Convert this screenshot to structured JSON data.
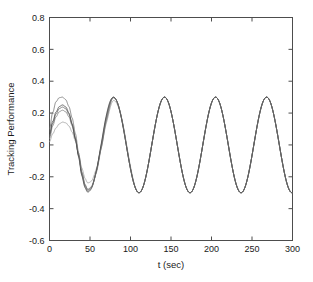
{
  "figure": {
    "background_color": "#ffffff",
    "axes_color": "#4d4d4d",
    "text_color": "#1a1a1a"
  },
  "chart_data": {
    "type": "line",
    "title": "",
    "xlabel": "t (sec)",
    "ylabel": "Tracking Performance",
    "xlim": [
      0,
      300
    ],
    "ylim": [
      -0.6,
      0.8
    ],
    "xticks": [
      0,
      50,
      100,
      150,
      200,
      250,
      300
    ],
    "xticklabels": [
      "0",
      "50",
      "100",
      "150",
      "200",
      "250",
      "300"
    ],
    "yticks": [
      -0.6,
      -0.4,
      -0.2,
      0,
      0.2,
      0.4,
      0.6,
      0.8
    ],
    "yticklabels": [
      "-0.6",
      "-0.4",
      "-0.2",
      "0",
      "0.2",
      "0.4",
      "0.6",
      "0.8"
    ],
    "grid": false,
    "legend": null,
    "legend_position": "none",
    "box": true,
    "steady_state": {
      "amplitude": 0.3,
      "period_sec": 63,
      "first_peak_t": 16,
      "peaks_t": [
        16,
        79,
        142,
        205,
        268
      ],
      "troughs_t": [
        47,
        110,
        173,
        236,
        299
      ],
      "offset": 0.0
    },
    "series": [
      {
        "name": "run-1",
        "color": "#9a9a9a",
        "line_width": 0.8,
        "initial_value": 0.02,
        "first_peak_value": 0.135,
        "first_trough_value": -0.205,
        "settle_t": 120,
        "x": [
          0,
          4,
          8,
          12,
          16,
          20,
          24,
          28,
          32,
          36,
          40,
          44,
          47,
          52,
          58,
          64,
          70,
          79,
          90,
          100,
          110,
          120,
          140,
          160,
          180,
          200,
          220,
          240,
          260,
          280,
          300
        ],
        "y": [
          0.02,
          0.07,
          0.105,
          0.128,
          0.135,
          0.128,
          0.108,
          0.075,
          0.03,
          -0.045,
          -0.12,
          -0.18,
          -0.205,
          -0.195,
          -0.145,
          -0.06,
          0.045,
          0.22,
          0.185,
          0.04,
          -0.24,
          -0.28,
          0.2,
          0.3,
          -0.18,
          -0.29,
          0.11,
          -0.29,
          0.3,
          -0.09,
          -0.3
        ]
      },
      {
        "name": "run-2",
        "color": "#7a7a7a",
        "line_width": 0.8,
        "initial_value": 0.04,
        "first_peak_value": 0.212,
        "first_trough_value": -0.258,
        "settle_t": 100,
        "x": [
          0,
          4,
          8,
          12,
          16,
          20,
          24,
          28,
          32,
          36,
          40,
          44,
          47,
          52,
          58,
          64,
          70,
          79,
          90,
          100,
          110,
          120,
          140,
          160,
          180,
          200,
          220,
          240,
          260,
          280,
          300
        ],
        "y": [
          0.04,
          0.12,
          0.175,
          0.205,
          0.212,
          0.2,
          0.17,
          0.12,
          0.05,
          -0.04,
          -0.15,
          -0.225,
          -0.258,
          -0.245,
          -0.18,
          -0.075,
          0.06,
          0.268,
          0.225,
          0.05,
          -0.285,
          -0.3,
          0.24,
          0.3,
          -0.21,
          -0.3,
          0.13,
          -0.3,
          0.3,
          -0.1,
          -0.3
        ]
      },
      {
        "name": "run-3",
        "color": "#5c5c5c",
        "line_width": 0.8,
        "initial_value": 0.055,
        "first_peak_value": 0.232,
        "first_trough_value": -0.275,
        "settle_t": 90,
        "x": [
          0,
          4,
          8,
          12,
          16,
          20,
          24,
          28,
          32,
          36,
          40,
          44,
          47,
          52,
          58,
          64,
          70,
          79,
          90,
          100,
          110,
          120,
          140,
          160,
          180,
          200,
          220,
          240,
          260,
          280,
          300
        ],
        "y": [
          0.055,
          0.135,
          0.193,
          0.225,
          0.232,
          0.22,
          0.188,
          0.133,
          0.058,
          -0.04,
          -0.16,
          -0.24,
          -0.275,
          -0.26,
          -0.192,
          -0.08,
          0.063,
          0.282,
          0.235,
          0.052,
          -0.295,
          -0.302,
          0.25,
          0.3,
          -0.22,
          -0.3,
          0.14,
          -0.3,
          0.3,
          -0.1,
          -0.3
        ]
      },
      {
        "name": "run-4",
        "color": "#3f3f3f",
        "line_width": 0.8,
        "initial_value": 0.07,
        "first_peak_value": 0.245,
        "first_trough_value": -0.288,
        "settle_t": 80,
        "x": [
          0,
          4,
          8,
          12,
          16,
          20,
          24,
          28,
          32,
          36,
          40,
          44,
          47,
          52,
          58,
          64,
          70,
          79,
          90,
          100,
          110,
          120,
          140,
          160,
          180,
          200,
          220,
          240,
          260,
          280,
          300
        ],
        "y": [
          0.07,
          0.148,
          0.206,
          0.238,
          0.245,
          0.232,
          0.198,
          0.14,
          0.062,
          -0.042,
          -0.168,
          -0.252,
          -0.288,
          -0.272,
          -0.2,
          -0.083,
          0.065,
          0.292,
          0.24,
          0.053,
          -0.3,
          -0.303,
          0.26,
          0.3,
          -0.23,
          -0.3,
          0.14,
          -0.3,
          0.3,
          -0.1,
          -0.3
        ]
      },
      {
        "name": "run-5",
        "color": "#6e6e6e",
        "line_width": 0.8,
        "initial_value": 0.1,
        "first_peak_value": 0.3,
        "first_trough_value": -0.268,
        "settle_t": 110,
        "x": [
          0,
          4,
          8,
          12,
          16,
          20,
          24,
          28,
          32,
          36,
          40,
          44,
          47,
          52,
          58,
          64,
          70,
          79,
          90,
          100,
          110,
          120,
          140,
          160,
          180,
          200,
          220,
          240,
          260,
          280,
          300
        ],
        "y": [
          0.1,
          0.205,
          0.272,
          0.297,
          0.3,
          0.285,
          0.245,
          0.18,
          0.09,
          -0.025,
          -0.15,
          -0.235,
          -0.268,
          -0.258,
          -0.195,
          -0.085,
          0.058,
          0.285,
          0.238,
          0.052,
          -0.292,
          -0.301,
          0.25,
          0.3,
          -0.22,
          -0.3,
          0.14,
          -0.3,
          0.3,
          -0.1,
          -0.3
        ]
      }
    ]
  }
}
